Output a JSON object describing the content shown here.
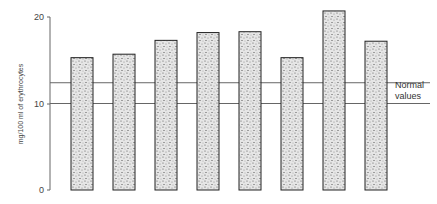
{
  "chart_data": {
    "type": "bar",
    "title": "",
    "xlabel": "",
    "ylabel": "mg/100 ml of erythrocytes",
    "ylim": [
      0,
      20
    ],
    "yticks": [
      0,
      10,
      20
    ],
    "categories": [
      "1",
      "2",
      "3",
      "4",
      "5",
      "6",
      "7",
      "8"
    ],
    "values": [
      15.3,
      15.7,
      17.3,
      18.2,
      18.3,
      15.3,
      20.7,
      17.2
    ],
    "reference_lines": [
      {
        "name": "Normal values (lower)",
        "value": 10.0
      },
      {
        "name": "Normal values (upper)",
        "value": 12.4
      }
    ],
    "annotation": "Normal values",
    "grid": false,
    "legend": "none"
  },
  "labels": {
    "ylabel": "mg/100 ml of erythrocytes",
    "tick0": "0",
    "tick10": "10",
    "tick20": "20",
    "note_line1": "Normal",
    "note_line2": "values"
  },
  "colors": {
    "bar_fill": "#cfcfcf",
    "bar_stroke": "#222222",
    "line": "#666666"
  }
}
